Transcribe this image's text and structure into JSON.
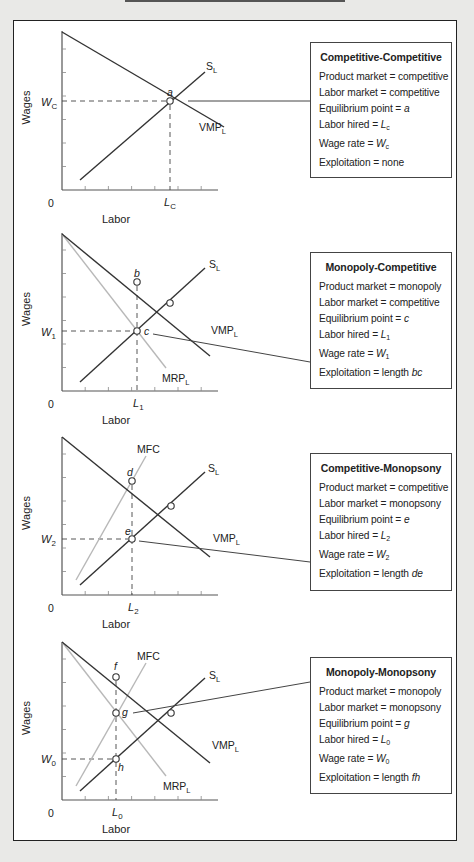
{
  "chart_data": {
    "type": "diagram",
    "title": "",
    "axis_labels": {
      "x": "Labor",
      "y": "Wages",
      "origin": "0"
    },
    "colors": {
      "dark_line": "#333333",
      "light_line": "#b8b8b8",
      "dashed": "#444444"
    },
    "panels": [
      {
        "name": "Competitive-Competitive",
        "curves": [
          "VMP_L",
          "S_L"
        ],
        "points": [
          {
            "label": "a",
            "role": "equilibrium"
          }
        ],
        "wage_label": {
          "base": "W",
          "sub": "C"
        },
        "labor_label": {
          "base": "L",
          "sub": "C"
        },
        "box": {
          "title": "Competitive-Competitive",
          "lines": [
            {
              "label": "Product market",
              "value": "competitive"
            },
            {
              "label": "Labor market",
              "value": "competitive"
            },
            {
              "label": "Equilibrium point",
              "value": "a",
              "italic": true
            },
            {
              "label": "Labor hired",
              "value": "L",
              "sub": "c",
              "italic": true
            },
            {
              "label": "Wage rate",
              "value": "W",
              "sub": "c",
              "italic": true
            },
            {
              "label": "Exploitation",
              "value": "none"
            }
          ]
        }
      },
      {
        "name": "Monopoly-Competitive",
        "curves": [
          "VMP_L",
          "MRP_L",
          "S_L"
        ],
        "points": [
          {
            "label": "b"
          },
          {
            "label": "c",
            "role": "equilibrium"
          }
        ],
        "wage_label": {
          "base": "W",
          "sub": "1"
        },
        "labor_label": {
          "base": "L",
          "sub": "1"
        },
        "box": {
          "title": "Monopoly-Competitive",
          "lines": [
            {
              "label": "Product market",
              "value": "monopoly"
            },
            {
              "label": "Labor market",
              "value": "competitive"
            },
            {
              "label": "Equilibrium point",
              "value": "c",
              "italic": true
            },
            {
              "label": "Labor hired",
              "value": "L",
              "sub": "1",
              "italic": true
            },
            {
              "label": "Wage rate",
              "value": "W",
              "sub": "1",
              "italic": true
            },
            {
              "label": "Exploitation",
              "value": "length ",
              "italic_tail": "bc"
            }
          ]
        }
      },
      {
        "name": "Competitive-Monopsony",
        "curves": [
          "VMP_L",
          "MFC",
          "S_L"
        ],
        "points": [
          {
            "label": "d"
          },
          {
            "label": "e",
            "role": "equilibrium"
          }
        ],
        "wage_label": {
          "base": "W",
          "sub": "2"
        },
        "labor_label": {
          "base": "L",
          "sub": "2"
        },
        "box": {
          "title": "Competitive-Monopsony",
          "lines": [
            {
              "label": "Product market",
              "value": "competitive"
            },
            {
              "label": "Labor market",
              "value": "monopsony"
            },
            {
              "label": "Equilibrium point",
              "value": "e",
              "italic": true
            },
            {
              "label": "Labor hired",
              "value": "L",
              "sub": "2",
              "italic": true
            },
            {
              "label": "Wage rate",
              "value": "W",
              "sub": "2",
              "italic": true
            },
            {
              "label": "Exploitation",
              "value": "length ",
              "italic_tail": "de"
            }
          ]
        }
      },
      {
        "name": "Monopoly-Monopsony",
        "curves": [
          "VMP_L",
          "MRP_L",
          "MFC",
          "S_L"
        ],
        "points": [
          {
            "label": "f"
          },
          {
            "label": "g",
            "role": "equilibrium"
          },
          {
            "label": "h"
          }
        ],
        "wage_label": {
          "base": "W",
          "sub": "0"
        },
        "labor_label": {
          "base": "L",
          "sub": "0"
        },
        "box": {
          "title": "Monopoly-Monopsony",
          "lines": [
            {
              "label": "Product market",
              "value": "monopoly"
            },
            {
              "label": "Labor market",
              "value": "monopsony"
            },
            {
              "label": "Equilibrium point",
              "value": "g",
              "italic": true
            },
            {
              "label": "Labor hired",
              "value": "L",
              "sub": "0",
              "italic": true
            },
            {
              "label": "Wage rate",
              "value": "W",
              "sub": "0",
              "italic": true
            },
            {
              "label": "Exploitation",
              "value": "length ",
              "italic_tail": "fh"
            }
          ]
        }
      }
    ]
  },
  "geometry": {
    "panels": [
      {
        "axisTop": 31,
        "axisY": 190,
        "box_top": 42,
        "box_height": 136,
        "lines": [
          {
            "kind": "dark",
            "x1": 62,
            "y1": 32,
            "x2": 224,
            "y2": 127,
            "label": "VMP",
            "sub": "L",
            "lx": 199,
            "ly": 131
          },
          {
            "kind": "dark",
            "x1": 80,
            "y1": 180,
            "x2": 205,
            "y2": 72,
            "label": "S",
            "sub": "L",
            "lx": 206,
            "ly": 70
          }
        ],
        "points": [
          {
            "x": 170,
            "y": 101,
            "label": "a",
            "lx": 167,
            "ly": 96
          }
        ],
        "hdash": {
          "y": 101,
          "x2": 166
        },
        "vdash": {
          "x": 170,
          "y1": 105
        },
        "wage_lx": 41,
        "wage_ly": 106,
        "labor_lx": 164,
        "connector": {
          "x1": 188,
          "y1": 101,
          "x2": 310,
          "y2": 101
        }
      },
      {
        "axisTop": 233,
        "axisY": 391,
        "box_top": 252,
        "box_height": 137,
        "lines": [
          {
            "kind": "light",
            "x1": 62,
            "y1": 234,
            "x2": 166,
            "y2": 368,
            "label": "MRP",
            "sub": "L",
            "lx": 162,
            "ly": 382
          },
          {
            "kind": "dark",
            "x1": 62,
            "y1": 234,
            "x2": 210,
            "y2": 356,
            "label": "VMP",
            "sub": "L",
            "lx": 211,
            "ly": 334
          },
          {
            "kind": "dark",
            "x1": 80,
            "y1": 382,
            "x2": 205,
            "y2": 268,
            "label": "S",
            "sub": "L",
            "lx": 209,
            "ly": 268
          }
        ],
        "points": [
          {
            "x": 137,
            "y": 282,
            "label": "b",
            "lx": 134,
            "ly": 277
          },
          {
            "x": 137,
            "y": 331,
            "label": "c",
            "lx": 144,
            "ly": 335
          },
          {
            "x": 170,
            "y": 303,
            "label": ""
          }
        ],
        "hdash": {
          "y": 331,
          "x2": 133
        },
        "vdash": {
          "x": 137,
          "y1": 286
        },
        "wage_lx": 41,
        "wage_ly": 336,
        "labor_lx": 133,
        "connector": {
          "x1": 153,
          "y1": 334,
          "x2": 310,
          "y2": 362
        }
      },
      {
        "axisTop": 437,
        "axisY": 595,
        "box_top": 453,
        "box_height": 138,
        "lines": [
          {
            "kind": "light",
            "x1": 76,
            "y1": 580,
            "x2": 146,
            "y2": 456,
            "label": "MFC",
            "sub": "",
            "lx": 137,
            "ly": 453
          },
          {
            "kind": "dark",
            "x1": 62,
            "y1": 437,
            "x2": 210,
            "y2": 557,
            "label": "VMP",
            "sub": "L",
            "lx": 213,
            "ly": 542
          },
          {
            "kind": "dark",
            "x1": 80,
            "y1": 585,
            "x2": 205,
            "y2": 472,
            "label": "S",
            "sub": "L",
            "lx": 208,
            "ly": 472
          }
        ],
        "points": [
          {
            "x": 132,
            "y": 481,
            "label": "d",
            "lx": 127,
            "ly": 476
          },
          {
            "x": 132,
            "y": 539,
            "label": "e",
            "lx": 125,
            "ly": 535
          },
          {
            "x": 171,
            "y": 506,
            "label": ""
          }
        ],
        "hdash": {
          "y": 539,
          "x2": 128
        },
        "vdash": {
          "x": 132,
          "y1": 485
        },
        "wage_lx": 41,
        "wage_ly": 543,
        "labor_lx": 128,
        "connector": {
          "x1": 139,
          "y1": 541,
          "x2": 310,
          "y2": 562
        }
      },
      {
        "axisTop": 642,
        "axisY": 800,
        "box_top": 657,
        "box_height": 137,
        "lines": [
          {
            "kind": "light",
            "x1": 62,
            "y1": 642,
            "x2": 166,
            "y2": 776,
            "label": "MRP",
            "sub": "L",
            "lx": 163,
            "ly": 790
          },
          {
            "kind": "light",
            "x1": 76,
            "y1": 786,
            "x2": 146,
            "y2": 663,
            "label": "MFC",
            "sub": "",
            "lx": 137,
            "ly": 660
          },
          {
            "kind": "dark",
            "x1": 62,
            "y1": 642,
            "x2": 210,
            "y2": 763,
            "label": "VMP",
            "sub": "L",
            "lx": 212,
            "ly": 749
          },
          {
            "kind": "dark",
            "x1": 80,
            "y1": 791,
            "x2": 205,
            "y2": 678,
            "label": "S",
            "sub": "L",
            "lx": 209,
            "ly": 679
          }
        ],
        "points": [
          {
            "x": 116,
            "y": 677,
            "label": "f",
            "lx": 114,
            "ly": 670
          },
          {
            "x": 116,
            "y": 713,
            "label": "g",
            "lx": 122,
            "ly": 716
          },
          {
            "x": 116,
            "y": 759,
            "label": "h",
            "lx": 118,
            "ly": 771
          },
          {
            "x": 171,
            "y": 713,
            "label": ""
          }
        ],
        "hdash": {
          "y": 759,
          "x2": 112
        },
        "vdash": {
          "x": 116,
          "y1": 681
        },
        "wage_lx": 41,
        "wage_ly": 763,
        "labor_lx": 112,
        "connector": {
          "x1": 133,
          "y1": 713,
          "x2": 310,
          "y2": 682
        }
      }
    ]
  }
}
